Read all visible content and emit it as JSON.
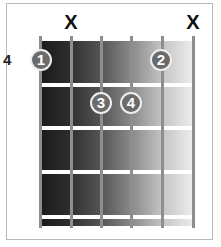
{
  "chord": {
    "start_fret_label": "4",
    "strings": [
      {
        "index": 1,
        "x": 40,
        "muted": false
      },
      {
        "index": 2,
        "x": 71,
        "muted": true
      },
      {
        "index": 3,
        "x": 101,
        "muted": false
      },
      {
        "index": 4,
        "x": 131,
        "muted": false
      },
      {
        "index": 5,
        "x": 162,
        "muted": false
      },
      {
        "index": 6,
        "x": 193,
        "muted": true
      }
    ],
    "frets_y": [
      38,
      84,
      127,
      171,
      216
    ],
    "mute_symbol": "X",
    "mutes": [
      {
        "string": 2,
        "label": "X"
      },
      {
        "string": 6,
        "label": "X"
      }
    ],
    "fingers": [
      {
        "finger": "1",
        "string": 1,
        "fret": 1
      },
      {
        "finger": "2",
        "string": 5,
        "fret": 1
      },
      {
        "finger": "3",
        "string": 3,
        "fret": 2
      },
      {
        "finger": "4",
        "string": 4,
        "fret": 2
      }
    ]
  },
  "colors": {
    "dot_fill": "#6b6b6b",
    "dot_border": "#eeeeee",
    "string": "#8e8e8e",
    "fret": "#ffffff",
    "gradient_dark": "#1a1a1a",
    "gradient_light": "#ededed"
  }
}
